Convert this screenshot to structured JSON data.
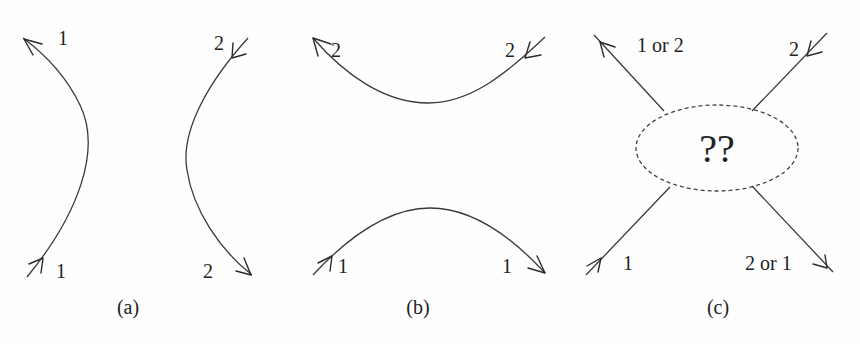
{
  "figure": {
    "panels": [
      {
        "caption": "(a)",
        "curves": [
          {
            "id": "left",
            "label_top": "1",
            "label_bottom": "1"
          },
          {
            "id": "right",
            "label_top": "2",
            "label_bottom": "2"
          }
        ]
      },
      {
        "caption": "(b)",
        "curves": [
          {
            "id": "top",
            "label_left": "2",
            "label_right": "2"
          },
          {
            "id": "bottom",
            "label_left": "1",
            "label_right": "1"
          }
        ]
      },
      {
        "caption": "(c)",
        "center_label": "??",
        "legs": [
          {
            "id": "top-left",
            "label": "1 or 2"
          },
          {
            "id": "top-right",
            "label": "2"
          },
          {
            "id": "bottom-left",
            "label": "1"
          },
          {
            "id": "bottom-right",
            "label": "2 or 1"
          }
        ]
      }
    ]
  }
}
